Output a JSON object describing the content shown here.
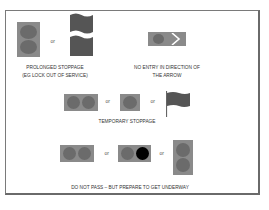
{
  "colors": {
    "panel": "#8a8a8a",
    "lamp_grey": "#6b6b6b",
    "lamp_black": "#000000",
    "flag": "#555555",
    "border": "#7a7a7a",
    "text": "#333333"
  },
  "separator": "or",
  "signals": [
    {
      "id": "prolonged-stoppage",
      "caption_line1": "PROLONGED STOPPAGE",
      "caption_line2": "(EG LOCK OUT OF SERVICE)",
      "variants": [
        "two-grey-lights-vertical",
        "wavy-flag"
      ]
    },
    {
      "id": "no-entry",
      "caption_line1": "NO ENTRY IN DIRECTION OF",
      "caption_line2": "THE ARROW",
      "variants": [
        "grey-light-with-arrow"
      ]
    },
    {
      "id": "temporary-stoppage",
      "caption_line1": "TEMPORARY STOPPAGE",
      "variants": [
        "two-grey-lights-horizontal",
        "one-grey-light",
        "flag"
      ]
    },
    {
      "id": "do-not-pass",
      "caption_line1": "DO NOT PASS – BUT PREPARE TO GET UNDERWAY",
      "variants": [
        "two-grey-lights-horizontal",
        "grey-and-black-light",
        "two-grey-lights-vertical"
      ]
    }
  ]
}
